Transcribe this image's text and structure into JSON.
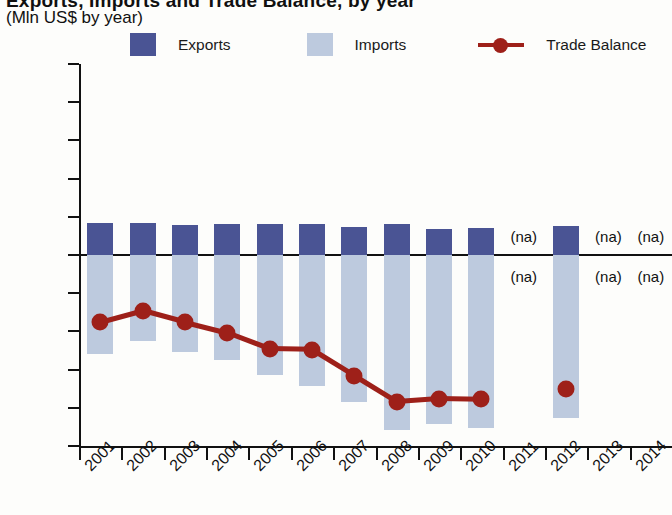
{
  "header": {
    "title": "Exports, Imports and Trade Balance, by year",
    "subtitle": "(Mln US$ by year)"
  },
  "legend": {
    "items": [
      {
        "label": "Exports",
        "color": "#4a5494",
        "marker": "square"
      },
      {
        "label": "Imports",
        "color": "#bdcade",
        "marker": "square"
      },
      {
        "label": "Trade Balance",
        "color": "#9e2019",
        "marker": "line-dot"
      }
    ]
  },
  "colors": {
    "exports": "#4a5494",
    "imports": "#bdcade",
    "trade_balance": "#9e2019",
    "axis": "#111111",
    "background": "#fdfdfb"
  },
  "chart_data": {
    "type": "bar",
    "title": "Exports, Imports and Trade Balance, by year",
    "subtitle": "(Mln US$ by year)",
    "xlabel": "",
    "ylabel": "Mln US$",
    "ylim": [
      -250,
      250
    ],
    "ytick_step": 50,
    "yticks": [
      250,
      200,
      150,
      100,
      50,
      0,
      -50,
      -100,
      -150,
      -200,
      -250
    ],
    "ytick_labels": [
      "250",
      "200",
      "150",
      "100",
      "50",
      "0",
      "−50",
      "−100",
      "−150",
      "−200",
      "−250"
    ],
    "grid": false,
    "legend_position": "top",
    "na_label": "(na)",
    "categories": [
      "2001",
      "2002",
      "2003",
      "2004",
      "2005",
      "2006",
      "2007",
      "2008",
      "2009",
      "2010",
      "2011",
      "2012",
      "2013",
      "2014"
    ],
    "series": [
      {
        "name": "Exports",
        "type": "bar",
        "color": "#4a5494",
        "values": [
          42,
          42,
          39,
          41,
          41,
          41,
          37,
          40,
          34,
          35,
          null,
          38,
          null,
          null
        ]
      },
      {
        "name": "Imports",
        "type": "bar",
        "color": "#bdcade",
        "values": [
          -129,
          -113,
          -127,
          -137,
          -157,
          -172,
          -192,
          -229,
          -221,
          -226,
          null,
          -213,
          null,
          null
        ]
      },
      {
        "name": "Trade Balance",
        "type": "line",
        "color": "#9e2019",
        "values": [
          -88,
          -73,
          -88,
          -102,
          -123,
          -124,
          -158,
          -192,
          -188,
          -189,
          null,
          -175,
          null,
          null
        ]
      }
    ],
    "missing_years": [
      "2011",
      "2013",
      "2014"
    ]
  }
}
